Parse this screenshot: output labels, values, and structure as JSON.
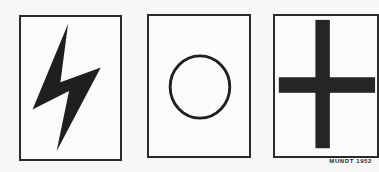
{
  "panels": [
    {
      "symbol": "lightning-bolt",
      "fill": "#1f1f1f"
    },
    {
      "symbol": "circle-outline",
      "stroke": "#1f1f1f"
    },
    {
      "symbol": "cross",
      "fill": "#252525"
    }
  ],
  "credit": "MUNDT 1952"
}
